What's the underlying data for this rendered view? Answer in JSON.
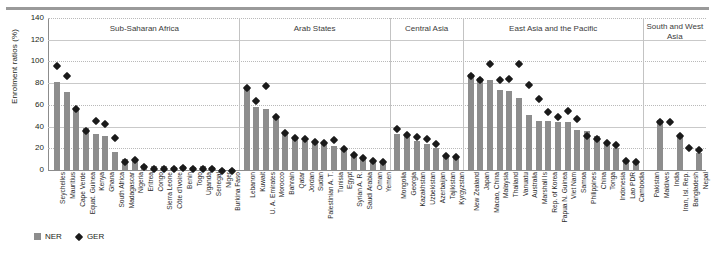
{
  "figure": {
    "ylabel": "Enrolment ratios (%)",
    "yticks": [
      0,
      20,
      40,
      60,
      80,
      100,
      120,
      140
    ]
  },
  "legend": {
    "items": [
      {
        "key": "ner",
        "label": "NER",
        "marker": "square",
        "color": "#8d8d8d"
      },
      {
        "key": "ger",
        "label": "GER",
        "marker": "diamond",
        "color": "#1a1a1a"
      }
    ]
  },
  "regions": [
    {
      "name": "Sub-Saharan Africa"
    },
    {
      "name": "Arab States"
    },
    {
      "name": "Central Asia"
    },
    {
      "name": "East Asia and the Pacific"
    },
    {
      "name": "South and West Asia"
    }
  ],
  "chart_data": {
    "type": "bar",
    "title": "",
    "xlabel": "",
    "ylabel": "Enrolment ratios (%)",
    "ylim": [
      0,
      140
    ],
    "ytick_step": 20,
    "grid": true,
    "legend_position": "bottom-left",
    "series": [
      {
        "name": "NER",
        "type": "bar",
        "color": "#8d8d8d"
      },
      {
        "name": "GER",
        "type": "scatter",
        "color": "#1a1a1a",
        "marker": "diamond"
      }
    ],
    "groups": [
      {
        "region": "Sub-Saharan Africa",
        "categories": [
          "Seychelles",
          "Mauritius",
          "Cape Verde",
          "Equat. Guinea",
          "Kenya",
          "Ghana",
          "South Africa",
          "Madagascar",
          "Nigeria",
          "Eritrea",
          "Congo",
          "Sierra Leone",
          "Côte d'Ivoire",
          "Benin",
          "Togo",
          "Uganda",
          "Senegal",
          "Niger",
          "Burkina Faso"
        ],
        "NER": [
          81,
          72,
          57,
          39,
          33,
          31,
          17,
          10,
          10,
          5,
          4,
          4,
          3,
          4,
          3,
          4,
          3,
          1,
          1
        ],
        "GER": [
          99,
          89,
          59,
          39,
          48,
          45,
          32,
          10,
          12,
          6,
          4,
          4,
          4,
          5,
          4,
          4,
          4,
          2,
          2
        ]
      },
      {
        "region": "Arab States",
        "categories": [
          "Lebanon",
          "Kuwait",
          "U. A. Emirates",
          "Morocco",
          "Bahrain",
          "Qatar",
          "Jordan",
          "Sudan",
          "Palestinian A. T.",
          "Tunisia",
          "Egypt",
          "Syrian A. R.",
          "Saudi Arabia",
          "Oman",
          "Yemen"
        ],
        "NER": [
          75,
          58,
          56,
          50,
          35,
          30,
          27,
          25,
          25,
          22,
          19,
          14,
          12,
          8,
          8
        ],
        "GER": [
          78,
          66,
          80,
          52,
          37,
          32,
          31,
          29,
          28,
          30,
          22,
          17,
          14,
          11,
          10
        ]
      },
      {
        "region": "Central Asia",
        "categories": [
          "Mongolia",
          "Georgia",
          "Kazakhstan",
          "Uzbekistan",
          "Azerbaijan",
          "Tajikistan",
          "Kyrgyzstan"
        ],
        "NER": [
          33,
          32,
          27,
          24,
          20,
          13,
          12
        ],
        "GER": [
          41,
          35,
          33,
          31,
          27,
          16,
          15
        ]
      },
      {
        "region": "East Asia and the Pacific",
        "categories": [
          "New Zealand",
          "Japan",
          "Macao, China",
          "Malaysia",
          "Thailand",
          "Vanuatu",
          "Australia",
          "Marshall Is",
          "Rep. of Korea",
          "Papua N. Guinea",
          "Viet Nam",
          "Samoa",
          "Philippines",
          "China",
          "Tonga",
          "Indonesia",
          "Lao PDR",
          "Cambodia"
        ],
        "NER": [
          88,
          85,
          83,
          74,
          73,
          66,
          51,
          45,
          45,
          44,
          44,
          37,
          36,
          31,
          26,
          20,
          8,
          7
        ],
        "GER": [
          89,
          86,
          100,
          86,
          87,
          100,
          81,
          68,
          56,
          52,
          57,
          50,
          34,
          31,
          28,
          26,
          11,
          10
        ]
      },
      {
        "region": "South and West Asia",
        "categories": [
          "Pakistan",
          "Maldives",
          "India",
          "Iran, Isl. Rep.",
          "Bangladesh",
          "Nepal"
        ],
        "NER": [
          0,
          46,
          0,
          32,
          0,
          16
        ],
        "GER": [
          0,
          47,
          47,
          34,
          23,
          21
        ]
      }
    ]
  }
}
